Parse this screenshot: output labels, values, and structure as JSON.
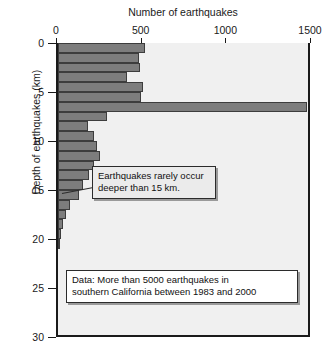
{
  "chart_data": {
    "type": "bar",
    "orientation": "horizontal",
    "title": "Number of earthquakes",
    "xlabel": "Number of earthquakes",
    "ylabel": "Depth of earthquakes (km)",
    "xlim": [
      0,
      1500
    ],
    "ylim": [
      0,
      30
    ],
    "xticks": [
      0,
      500,
      1000,
      1500
    ],
    "xtick_labels": [
      "0",
      "500",
      "1000",
      "1500"
    ],
    "yticks": [
      0,
      5,
      10,
      15,
      20,
      25,
      30
    ],
    "ytick_labels": [
      "0",
      "5",
      "10",
      "15",
      "20",
      "25",
      "30"
    ],
    "grid": false,
    "legend": false,
    "bin_width_km": 1,
    "categories": [
      "0-1",
      "1-2",
      "2-3",
      "3-4",
      "4-5",
      "5-6",
      "6-7",
      "7-8",
      "8-9",
      "9-10",
      "10-11",
      "11-12",
      "12-13",
      "13-14",
      "14-15",
      "15-16",
      "16-17",
      "17-18",
      "18-19",
      "19-20",
      "20-21"
    ],
    "values": [
      515,
      480,
      485,
      410,
      500,
      490,
      1470,
      290,
      180,
      215,
      230,
      250,
      215,
      185,
      150,
      125,
      70,
      45,
      30,
      18,
      8
    ],
    "annotations": [
      {
        "name": "shallow-note",
        "text": "Earthquakes rarely occur deeper than 15 km.",
        "lines": [
          "Earthquakes rarely occur",
          "deeper than 15 km."
        ],
        "points_to_depth_km": 15.5
      },
      {
        "name": "data-source-note",
        "text": "Data: More than 5000 earthquakes in southern California between 1983 and 2000",
        "lines": [
          "Data: More than 5000 earthquakes in",
          "southern California between 1983 and 2000"
        ]
      }
    ],
    "colors": {
      "bar_fill": "#7d7d7d",
      "bar_edge": "#3d3d3d",
      "plot_background": "#f0f0f0",
      "axis": "#1a1a1a",
      "page_background": "#ffffff"
    }
  }
}
